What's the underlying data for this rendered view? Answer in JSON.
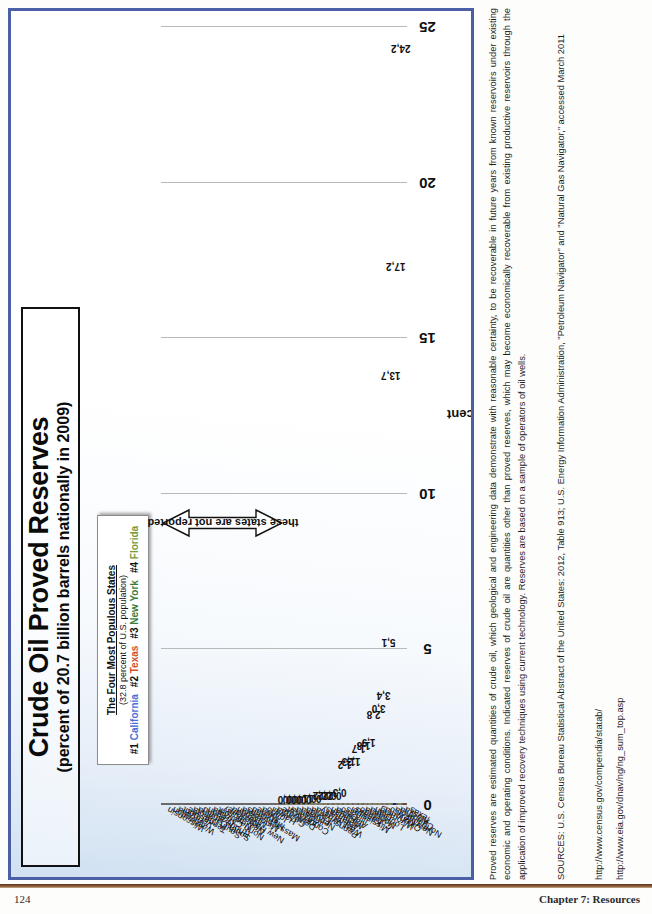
{
  "page": {
    "number": "124",
    "chapter": "Chapter 7: Resources"
  },
  "chart": {
    "title_main": "Crude Oil Proved Reserves",
    "title_sub": "(percent of 20.7 billion barrels nationally in 2009)",
    "legend": {
      "title": "The Four Most Populous States",
      "subtitle": "(32.8 percent of U.S. population)",
      "items": [
        {
          "rank": "#1",
          "state": "California",
          "color": "#4a6fd4"
        },
        {
          "rank": "#2",
          "state": "Texas",
          "color": "#d2502a"
        },
        {
          "rank": "#3",
          "state": "New York",
          "color": "#3b7d3b"
        },
        {
          "rank": "#4",
          "state": "Florida",
          "color": "#7a9a3a"
        }
      ]
    },
    "not_reported_label": "these states are not reported"
  },
  "chart_data": {
    "type": "bar",
    "orientation": "horizontal-printed-sideways",
    "title": "Crude Oil Proved Reserves",
    "subtitle": "(percent of 20.7 billion barrels nationally in 2009)",
    "xlabel": "",
    "ylabel": "percent",
    "ylim": [
      0,
      25
    ],
    "yticks": [
      "0",
      "5",
      "10",
      "15",
      "20",
      "25"
    ],
    "grid": true,
    "legend_position": "top-left-callout",
    "highlight_colors": {
      "default": "#cfc6ad",
      "texas": "#d4531f",
      "california": "#2e46a0"
    },
    "categories": [
      "Texas",
      "Alaska",
      "California",
      "North Dakota",
      "New Mexico",
      "Oklahoma",
      "Wyoming",
      "Utah",
      "Louisiana",
      "Montana",
      "Colorado",
      "Kansas",
      "Mississippi",
      "Illinois",
      "Ohio",
      "Alabama",
      "Michigan",
      "Arkansas",
      "Kentucky",
      "West Virginia",
      "Pennsylvania",
      "Florida",
      "Nebraska",
      "Indiana",
      "Arizona",
      "Connecticut",
      "Delaware",
      "Georgia",
      "Hawaii",
      "Idaho",
      "Iowa",
      "Maine",
      "Maryland",
      "Massachusetts",
      "Minnesota",
      "Missouri",
      "Nevada",
      "New Hampshire",
      "New Jersey",
      "New York",
      "North Carolina",
      "Oregon",
      "Rhode Island",
      "South Carolina",
      "South Dakota",
      "Tennessee",
      "Vermont",
      "Virginia",
      "Washington",
      "Wisconsin"
    ],
    "values": [
      24.2,
      17.2,
      13.7,
      5.1,
      3.4,
      3.0,
      2.8,
      1.9,
      1.8,
      1.7,
      1.3,
      1.3,
      1.2,
      0.3,
      0.2,
      0.2,
      0.2,
      0.2,
      0.1,
      0.1,
      0.0,
      0.0,
      0.0,
      0.0,
      0.0,
      null,
      null,
      null,
      null,
      null,
      null,
      null,
      null,
      null,
      null,
      null,
      null,
      null,
      null,
      null,
      null,
      null,
      null,
      null,
      null,
      null,
      null,
      null,
      null,
      null
    ],
    "value_labels": [
      "24,2",
      "17,2",
      "13,7",
      "5,1",
      "3,4",
      "3,0",
      "2,8",
      "1,9",
      "1,8",
      "1,7",
      "1,3",
      "1,3",
      "1,2",
      "0,3",
      "0,2",
      "0,2",
      "0,2",
      "0,2",
      "0,1",
      "0,1",
      "0,0",
      "0,0",
      "0,0",
      "0,0",
      "0,0",
      "",
      "",
      "",
      "",
      "",
      "",
      "",
      "",
      "",
      "",
      "",
      "",
      "",
      "",
      "",
      "",
      "",
      "",
      "",
      "",
      "",
      "",
      "",
      "",
      ""
    ],
    "annotation": "these states are not reported",
    "annotation_applies_to": [
      "Connecticut",
      "Delaware",
      "Georgia",
      "Hawaii",
      "Idaho",
      "Iowa",
      "Maine",
      "Maryland",
      "Massachusetts",
      "Minnesota",
      "Missouri",
      "Nevada",
      "New Hampshire",
      "New Jersey",
      "New York",
      "North Carolina",
      "Oregon",
      "Rhode Island",
      "South Carolina",
      "South Dakota",
      "Tennessee",
      "Vermont",
      "Virginia",
      "Washington",
      "Wisconsin"
    ]
  },
  "notes": {
    "paragraph1": "Proved reserves are estimated quantities of crude oil, which geological and engineering data demonstrate with reasonable certainty, to be recoverable in future years from known reservoirs under existing economic and operating conditions.  Indicated reserves of crude oil are quantities other than proved reserves, which may become economically recoverable from existing productive reservoirs through the application of improved recovery techniques using current technology. Reserves are based on a sample of operators of oil wells.",
    "sources": "SOURCES: U.S. Census Bureau Statistical Abstract of the United States: 2012, Table 913; U.S. Energy Information Administration, \"Petroleum Navigator\" and \"Natural Gas Navigator,\" accessed March 2011",
    "url1": "http://www.census.gov/compendia/statab/",
    "url2": "http://www.eia.gov/dnav/ng/ng_sum_top.asp"
  }
}
